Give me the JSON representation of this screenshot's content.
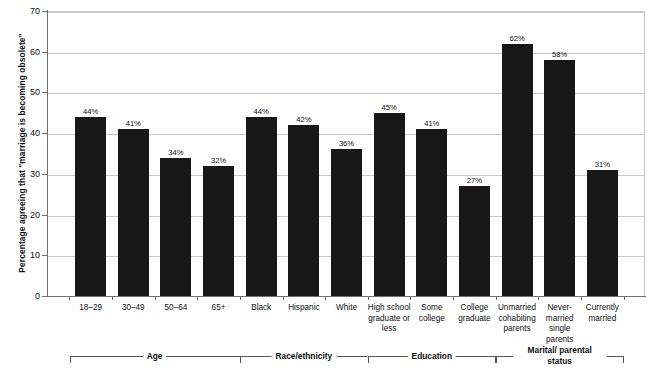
{
  "chart_data": {
    "type": "bar",
    "title": "",
    "xlabel": "",
    "ylabel": "Percentage agreeing that \"marriage is becoming obsolete\"",
    "ylim": [
      0,
      70
    ],
    "yticks": [
      0,
      10,
      20,
      30,
      40,
      50,
      60,
      70
    ],
    "grid": true,
    "legend": "none",
    "categories": [
      "18–29",
      "30–49",
      "50–64",
      "65+",
      "Black",
      "Hispanic",
      "White",
      "High school graduate or less",
      "Some college",
      "College graduate",
      "Unmarried cohabiting parents",
      "Never-married single parents",
      "Currently married"
    ],
    "values": [
      44,
      41,
      34,
      32,
      44,
      42,
      36,
      45,
      41,
      27,
      62,
      58,
      31
    ],
    "data_labels": [
      "44%",
      "41%",
      "34%",
      "32%",
      "44%",
      "42%",
      "36%",
      "45%",
      "41%",
      "27%",
      "62%",
      "58%",
      "31%"
    ],
    "bar_color": "#171717",
    "groups": [
      {
        "label": "Age",
        "start_index": 0,
        "end_index": 3
      },
      {
        "label": "Race/ethnicity",
        "start_index": 4,
        "end_index": 6
      },
      {
        "label": "Education",
        "start_index": 7,
        "end_index": 9
      },
      {
        "label": "Marital/ parental status",
        "start_index": 10,
        "end_index": 12
      }
    ]
  },
  "axis": {
    "y_title": "Percentage agreeing that \"marriage is becoming obsolete\"",
    "tick_labels": [
      "70",
      "60",
      "50",
      "40",
      "30",
      "20",
      "10",
      "0"
    ]
  },
  "x_labels": [
    "18–29",
    "30–49",
    "50–64",
    "65+",
    "Black",
    "Hispanic",
    "White",
    "High school graduate or less",
    "Some college",
    "College graduate",
    "Unmarried cohabiting parents",
    "Never-married single parents",
    "Currently married"
  ],
  "bar_labels": [
    "44%",
    "41%",
    "34%",
    "32%",
    "44%",
    "42%",
    "36%",
    "45%",
    "41%",
    "27%",
    "62%",
    "58%",
    "31%"
  ],
  "group_labels": [
    "Age",
    "Race/ethnicity",
    "Education",
    "Marital/ parental status"
  ],
  "colors": {
    "bar": "#171717",
    "grid": "#c9c9c9",
    "axis": "#6f6f6f",
    "text": "#111111",
    "background": "#ffffff"
  }
}
